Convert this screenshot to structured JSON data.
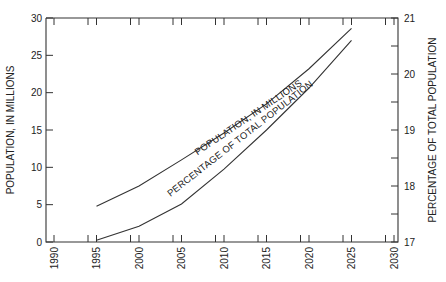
{
  "chart_data": {
    "type": "line",
    "title": "",
    "xlabel": "",
    "ylabel": "POPULATION, IN MILLIONS",
    "ylabel_right": "PERCENTAGE OF TOTAL POPULATION",
    "xlim": [
      1990,
      2030
    ],
    "ylim": [
      0,
      30
    ],
    "ylim_right": [
      17,
      21
    ],
    "grid": false,
    "legend": "inline labels along curves",
    "x_ticks": [
      "1990",
      "1995",
      "2000",
      "2005",
      "2010",
      "2015",
      "2020",
      "2025",
      "2030"
    ],
    "y_ticks": [
      "0",
      "5",
      "10",
      "15",
      "20",
      "25",
      "30"
    ],
    "y_ticks_right": [
      "17",
      "18",
      "19",
      "20",
      "21"
    ],
    "x": [
      1995,
      2000,
      2005,
      2010,
      2015,
      2020,
      2025
    ],
    "series": [
      {
        "name": "POPULATION, IN MILLIONS",
        "axis": "left",
        "values": [
          4.8,
          7.5,
          11.0,
          14.6,
          18.5,
          23.2,
          28.6
        ]
      },
      {
        "name": "PERCENTAGE OF TOTAL POPULATION",
        "axis": "right",
        "values": [
          17.03,
          17.28,
          17.68,
          18.3,
          19.0,
          19.75,
          20.6
        ]
      }
    ]
  },
  "labels": {
    "left_axis_title": "POPULATION, IN MILLIONS",
    "right_axis_title": "PERCENTAGE OF TOTAL POPULATION",
    "curve_population": "POPULATION, IN MILLIONS",
    "curve_percentage": "PERCENTAGE OF TOTAL POPULATION"
  }
}
